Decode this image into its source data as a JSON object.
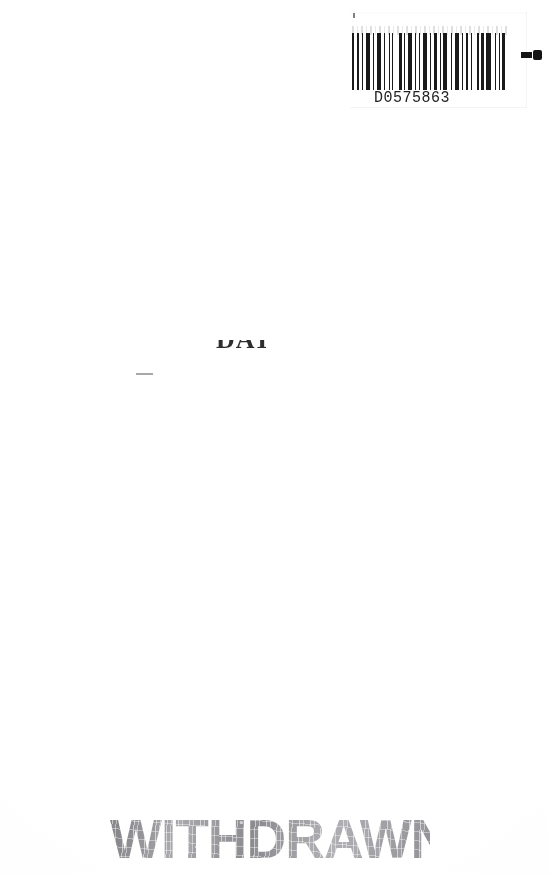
{
  "page": {
    "width": 549,
    "height": 875,
    "background_color": "#ffffff"
  },
  "barcode": {
    "number": "D0575863",
    "ink_color": "#1a1a1a",
    "bar_pattern": [
      3,
      2,
      2,
      3,
      1,
      3,
      4,
      2,
      2,
      2,
      5,
      2,
      2,
      3,
      1,
      2,
      2,
      5,
      3,
      2,
      1,
      3,
      4,
      2,
      2,
      2,
      1,
      3,
      5,
      2,
      2,
      2,
      3,
      3,
      1,
      2,
      4,
      3,
      2,
      2,
      5,
      2,
      1,
      3,
      3,
      2,
      2,
      4,
      2,
      2,
      3,
      2,
      5,
      3,
      2,
      2,
      1,
      2,
      4,
      3
    ],
    "end_mark": "dash-dot",
    "tick_mark": "corner-tick"
  },
  "faded_marks": {
    "text_fragment": "DAT",
    "dash": "—"
  },
  "stamp": {
    "label": "WITHDRAWN",
    "color": "#9a9a9e",
    "style": "distressed-bold"
  }
}
